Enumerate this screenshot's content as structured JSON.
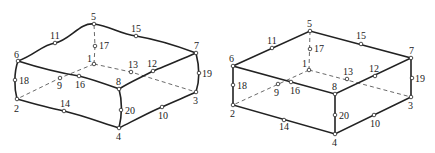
{
  "figures": [
    {
      "name": "curved-20-node-hexahedron",
      "nodes": [
        {
          "id": "1",
          "x": 94,
          "y": 64,
          "lx": 87,
          "ly": 62
        },
        {
          "id": "2",
          "x": 17,
          "y": 99,
          "lx": 14,
          "ly": 112
        },
        {
          "id": "3",
          "x": 196,
          "y": 92,
          "lx": 193,
          "ly": 104
        },
        {
          "id": "4",
          "x": 119,
          "y": 128,
          "lx": 116,
          "ly": 140
        },
        {
          "id": "5",
          "x": 94,
          "y": 24,
          "lx": 91,
          "ly": 20
        },
        {
          "id": "6",
          "x": 18,
          "y": 61,
          "lx": 14,
          "ly": 58
        },
        {
          "id": "7",
          "x": 196,
          "y": 53,
          "lx": 194,
          "ly": 49
        },
        {
          "id": "8",
          "x": 119,
          "y": 89,
          "lx": 116,
          "ly": 85
        },
        {
          "id": "9",
          "x": 60,
          "y": 78,
          "lx": 57,
          "ly": 89
        },
        {
          "id": "10",
          "x": 162,
          "y": 107,
          "lx": 158,
          "ly": 119
        },
        {
          "id": "11",
          "x": 55,
          "y": 43,
          "lx": 50,
          "ly": 39
        },
        {
          "id": "12",
          "x": 153,
          "y": 71,
          "lx": 147,
          "ly": 67
        },
        {
          "id": "13",
          "x": 131,
          "y": 72,
          "lx": 128,
          "ly": 68
        },
        {
          "id": "14",
          "x": 64,
          "y": 111,
          "lx": 60,
          "ly": 107
        },
        {
          "id": "15",
          "x": 136,
          "y": 36,
          "lx": 131,
          "ly": 32
        },
        {
          "id": "16",
          "x": 79,
          "y": 76,
          "lx": 75,
          "ly": 88
        },
        {
          "id": "17",
          "x": 95,
          "y": 46,
          "lx": 99,
          "ly": 49
        },
        {
          "id": "18",
          "x": 15,
          "y": 80,
          "lx": 19,
          "ly": 84
        },
        {
          "id": "19",
          "x": 199,
          "y": 73,
          "lx": 202,
          "ly": 77
        },
        {
          "id": "20",
          "x": 121,
          "y": 110,
          "lx": 125,
          "ly": 114
        }
      ]
    },
    {
      "name": "straight-20-node-hexahedron",
      "nodes": [
        {
          "id": "1",
          "x": 309,
          "y": 70,
          "lx": 302,
          "ly": 67
        },
        {
          "id": "2",
          "x": 233,
          "y": 105,
          "lx": 230,
          "ly": 117
        },
        {
          "id": "3",
          "x": 411,
          "y": 97,
          "lx": 408,
          "ly": 109
        },
        {
          "id": "4",
          "x": 335,
          "y": 134,
          "lx": 332,
          "ly": 146
        },
        {
          "id": "5",
          "x": 310,
          "y": 31,
          "lx": 307,
          "ly": 27
        },
        {
          "id": "6",
          "x": 233,
          "y": 66,
          "lx": 229,
          "ly": 62
        },
        {
          "id": "7",
          "x": 411,
          "y": 58,
          "lx": 409,
          "ly": 54
        },
        {
          "id": "8",
          "x": 335,
          "y": 94,
          "lx": 332,
          "ly": 90
        },
        {
          "id": "9",
          "x": 278,
          "y": 84,
          "lx": 274,
          "ly": 96
        },
        {
          "id": "10",
          "x": 374,
          "y": 115,
          "lx": 370,
          "ly": 127
        },
        {
          "id": "11",
          "x": 272,
          "y": 48,
          "lx": 267,
          "ly": 44
        },
        {
          "id": "12",
          "x": 375,
          "y": 76,
          "lx": 369,
          "ly": 72
        },
        {
          "id": "13",
          "x": 347,
          "y": 79,
          "lx": 343,
          "ly": 75
        },
        {
          "id": "14",
          "x": 284,
          "y": 120,
          "lx": 279,
          "ly": 130
        },
        {
          "id": "15",
          "x": 361,
          "y": 44,
          "lx": 356,
          "ly": 39
        },
        {
          "id": "16",
          "x": 291,
          "y": 82,
          "lx": 290,
          "ly": 94
        },
        {
          "id": "17",
          "x": 310,
          "y": 49,
          "lx": 314,
          "ly": 52
        },
        {
          "id": "18",
          "x": 233,
          "y": 85,
          "lx": 237,
          "ly": 89
        },
        {
          "id": "19",
          "x": 412,
          "y": 78,
          "lx": 415,
          "ly": 82
        },
        {
          "id": "20",
          "x": 335,
          "y": 115,
          "lx": 339,
          "ly": 119
        }
      ]
    }
  ]
}
